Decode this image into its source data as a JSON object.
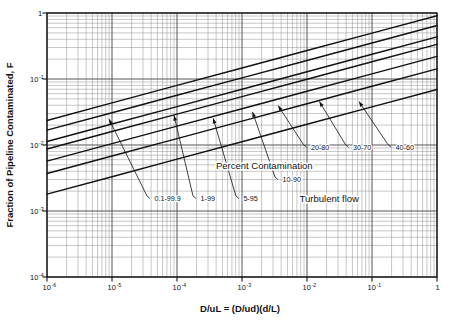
{
  "chart_data": {
    "type": "line",
    "title": "",
    "xlabel": "D/uL = (D/ud)(d/L)",
    "ylabel": "Fraction of Pipeline Contaminated, F",
    "xscale": "log",
    "yscale": "log",
    "xlim": [
      1e-06,
      1
    ],
    "ylim": [
      0.0001,
      1
    ],
    "grid": true,
    "grid_minor": true,
    "legend": "inline-labels",
    "xticklabels": [
      "10-6",
      "10-5",
      "10-4",
      "10-3",
      "10-2",
      "10-1",
      "1"
    ],
    "xtick_mantissas": [
      "10",
      "10",
      "10",
      "10",
      "10",
      "10",
      "1"
    ],
    "xtick_exponents": [
      "-6",
      "-5",
      "-4",
      "-3",
      "-2",
      "-1",
      ""
    ],
    "yticklabels": [
      "1",
      "10-1",
      "10-2",
      "10-3",
      "10-4"
    ],
    "ytick_mantissas": [
      "1",
      "10",
      "10",
      "10",
      "10"
    ],
    "ytick_exponents": [
      "",
      "-1",
      "-2",
      "-3",
      "-4"
    ],
    "annotations": [
      {
        "name": "percent-contamination",
        "text": "Percent Contamination",
        "x": 0.0022,
        "y": 0.0043
      },
      {
        "name": "turbulent-flow",
        "text": "Turbulent flow",
        "x": 0.022,
        "y": 0.00135
      }
    ],
    "series": [
      {
        "name": "0.1-99.9",
        "label": "0.1-99.9",
        "percent_low": 0.1,
        "percent_high": 99.9,
        "x": [
          1e-06,
          1e-05,
          0.0001,
          0.001,
          0.01,
          0.1,
          1
        ],
        "y": [
          0.0235,
          0.0435,
          0.08,
          0.147,
          0.27,
          0.496,
          0.91
        ],
        "label_x": 4.5e-05,
        "label_y": 0.00155,
        "arrow_tip_x": 9e-06,
        "arrow_tip_y": 0.0247
      },
      {
        "name": "1-99",
        "label": "1-99",
        "percent_low": 1,
        "percent_high": 99,
        "x": [
          1e-06,
          1e-05,
          0.0001,
          0.001,
          0.01,
          0.1,
          1
        ],
        "y": [
          0.0168,
          0.0308,
          0.0566,
          0.104,
          0.191,
          0.351,
          0.645
        ],
        "label_x": 0.00023,
        "label_y": 0.00155,
        "arrow_tip_x": 9e-05,
        "arrow_tip_y": 0.028
      },
      {
        "name": "5-95",
        "label": "5-95",
        "percent_low": 5,
        "percent_high": 95,
        "x": [
          1e-06,
          1e-05,
          0.0001,
          0.001,
          0.01,
          0.1,
          1
        ],
        "y": [
          0.0113,
          0.0208,
          0.0382,
          0.0701,
          0.1288,
          0.2366,
          0.435
        ],
        "label_x": 0.00105,
        "label_y": 0.00155,
        "arrow_tip_x": 0.00036,
        "arrow_tip_y": 0.0255
      },
      {
        "name": "10-90",
        "label": "10-90",
        "percent_low": 10,
        "percent_high": 90,
        "x": [
          1e-06,
          1e-05,
          0.0001,
          0.001,
          0.01,
          0.1,
          1
        ],
        "y": [
          0.0087,
          0.016,
          0.0294,
          0.054,
          0.0992,
          0.1823,
          0.335
        ],
        "label_x": 0.0042,
        "label_y": 0.003,
        "arrow_tip_x": 0.00145,
        "arrow_tip_y": 0.0317
      },
      {
        "name": "20-80",
        "label": "20-80",
        "percent_low": 20,
        "percent_high": 80,
        "x": [
          1e-06,
          1e-05,
          0.0001,
          0.001,
          0.01,
          0.1,
          1
        ],
        "y": [
          0.0057,
          0.0105,
          0.0193,
          0.0354,
          0.0651,
          0.1196,
          0.22
        ],
        "label_x": 0.0115,
        "label_y": 0.0093,
        "arrow_tip_x": 0.0036,
        "arrow_tip_y": 0.0395
      },
      {
        "name": "30-70",
        "label": "30-70",
        "percent_low": 30,
        "percent_high": 70,
        "x": [
          1e-06,
          1e-05,
          0.0001,
          0.001,
          0.01,
          0.1,
          1
        ],
        "y": [
          0.0037,
          0.0068,
          0.0125,
          0.023,
          0.0422,
          0.0776,
          0.1425
        ],
        "label_x": 0.051,
        "label_y": 0.0093,
        "arrow_tip_x": 0.0155,
        "arrow_tip_y": 0.0455
      },
      {
        "name": "40-60",
        "label": "40-60",
        "percent_low": 40,
        "percent_high": 60,
        "x": [
          1e-06,
          1e-05,
          0.0001,
          0.001,
          0.01,
          0.1,
          1
        ],
        "y": [
          0.0018,
          0.0033,
          0.0061,
          0.0112,
          0.0206,
          0.0378,
          0.0695
        ],
        "label_x": 0.23,
        "label_y": 0.0093,
        "arrow_tip_x": 0.063,
        "arrow_tip_y": 0.0455
      }
    ]
  },
  "colors": {
    "ink": "#111111",
    "grid_major": "#555555",
    "grid_minor": "#999999",
    "background": "#ffffff"
  }
}
